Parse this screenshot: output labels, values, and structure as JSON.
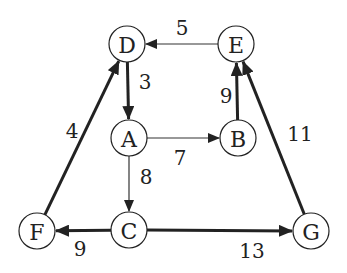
{
  "diagram": {
    "type": "directed-weighted-graph",
    "nodes": [
      {
        "id": "D",
        "label": "D",
        "x": 127,
        "y": 44
      },
      {
        "id": "E",
        "label": "E",
        "x": 236,
        "y": 44
      },
      {
        "id": "A",
        "label": "A",
        "x": 129,
        "y": 138
      },
      {
        "id": "B",
        "label": "B",
        "x": 238,
        "y": 138
      },
      {
        "id": "F",
        "label": "F",
        "x": 37,
        "y": 231
      },
      {
        "id": "C",
        "label": "C",
        "x": 129,
        "y": 230
      },
      {
        "id": "G",
        "label": "G",
        "x": 311,
        "y": 231
      }
    ],
    "edges": [
      {
        "from": "E",
        "to": "D",
        "weight": "5",
        "style": "thin",
        "label_x": 182,
        "label_y": 28
      },
      {
        "from": "D",
        "to": "A",
        "weight": "3",
        "style": "thick",
        "label_x": 145,
        "label_y": 82
      },
      {
        "from": "A",
        "to": "B",
        "weight": "7",
        "style": "thin",
        "label_x": 180,
        "label_y": 158
      },
      {
        "from": "A",
        "to": "C",
        "weight": "8",
        "style": "thin",
        "label_x": 146,
        "label_y": 177
      },
      {
        "from": "B",
        "to": "E",
        "weight": "9",
        "style": "thick",
        "label_x": 226,
        "label_y": 96
      },
      {
        "from": "F",
        "to": "D",
        "weight": "4",
        "style": "thick",
        "label_x": 72,
        "label_y": 131
      },
      {
        "from": "G",
        "to": "E",
        "weight": "11",
        "style": "thick",
        "label_x": 300,
        "label_y": 134
      },
      {
        "from": "C",
        "to": "F",
        "weight": "9",
        "style": "thick",
        "label_x": 80,
        "label_y": 249
      },
      {
        "from": "C",
        "to": "G",
        "weight": "13",
        "style": "thick",
        "label_x": 252,
        "label_y": 251
      }
    ],
    "node_radius": 18,
    "colors": {
      "stroke": "#222222",
      "background": "#ffffff"
    }
  }
}
